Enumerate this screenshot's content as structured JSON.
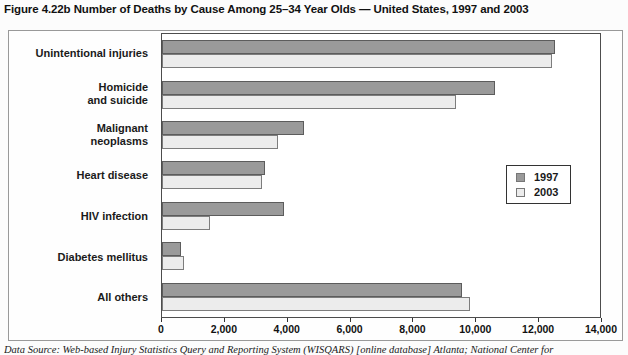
{
  "title": "Figure 4.22b Number of Deaths by Cause Among 25–34 Year Olds — United States, 1997 and 2003",
  "caption": "Data Source: Web-based Injury Statistics Query and Reporting System (WISQARS) [online database] Atlanta; National Center for",
  "colors": {
    "bar_1997": "#9a9a9a",
    "bar_1997_border": "#5c5c5c",
    "bar_2003": "#ececec",
    "bar_2003_border": "#7d7d7d",
    "plot_border": "#4d4d4d",
    "figure_border": "#999999"
  },
  "legend": {
    "items": [
      {
        "label": "1997"
      },
      {
        "label": "2003"
      }
    ]
  },
  "chart_data": {
    "type": "bar",
    "orientation": "horizontal",
    "title": "Figure 4.22b Number of Deaths by Cause Among 25–34 Year Olds — United States, 1997 and 2003",
    "categories": [
      "Unintentional injuries",
      "Homicide and suicide",
      "Malignant neoplasms",
      "Heart disease",
      "HIV infection",
      "Diabetes mellitus",
      "All others"
    ],
    "category_labels": [
      "Unintentional injuries",
      "Homicide\nand suicide",
      "Malignant\nneoplasms",
      "Heart disease",
      "HIV infection",
      "Diabetes mellitus",
      "All others"
    ],
    "series": [
      {
        "name": "1997",
        "values": [
          12550,
          10650,
          4550,
          3300,
          3900,
          600,
          9600
        ]
      },
      {
        "name": "2003",
        "values": [
          12450,
          9400,
          3700,
          3200,
          1550,
          700,
          9850
        ]
      }
    ],
    "xlabel": "",
    "ylabel": "",
    "xlim": [
      0,
      14000
    ],
    "x_ticks": [
      "0",
      "2,000",
      "4,000",
      "6,000",
      "8,000",
      "10,000",
      "12,000",
      "14,000"
    ],
    "grid": false,
    "legend_position": "right-center"
  }
}
